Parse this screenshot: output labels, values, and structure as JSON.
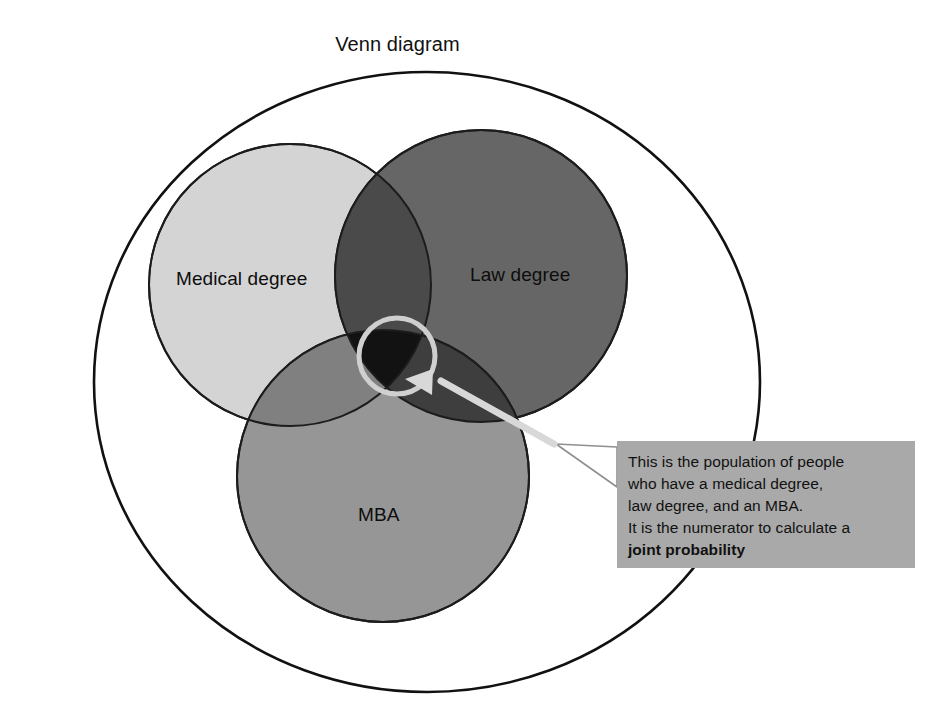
{
  "title": "Venn diagram",
  "sets": [
    {
      "key": "medical",
      "label": "Medical degree",
      "color": "#d4d4d4"
    },
    {
      "key": "law",
      "label": "Law degree",
      "color": "#666666"
    },
    {
      "key": "mba",
      "label": "MBA",
      "color": "#969696"
    }
  ],
  "intersections": {
    "medical_law": "#4a4a4a",
    "medical_mba": "#808080",
    "law_mba": "#3e3e3e",
    "all_three": "#121212"
  },
  "highlight": {
    "ring_color": "#cfcfcf",
    "arrow_color": "#d8d8d8"
  },
  "callout": {
    "background": "#a9a9a9",
    "lines": [
      "This is the population of people",
      "who have a medical degree,",
      "law degree, and an MBA.",
      "It is the numerator to calculate a",
      "joint probability"
    ],
    "bold_line_index": 4
  },
  "outline_color": "#111111",
  "background": "#ffffff"
}
